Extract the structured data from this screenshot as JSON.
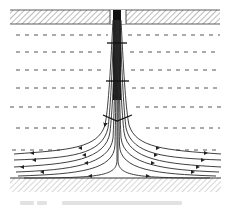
{
  "figure": {
    "type": "flow-field-schematic",
    "top_wall": {
      "hatched": true
    },
    "bottom_wall": {
      "hatched": true
    },
    "jet": {
      "direction": "downward",
      "position": "center"
    },
    "dashed_layers": 7,
    "streamlines_per_side": 6,
    "colors": {
      "line": "#333333",
      "hatch": "#555555",
      "dash": "#444444",
      "caption": "#e2e2e2"
    }
  },
  "caption": {
    "legible": false
  }
}
